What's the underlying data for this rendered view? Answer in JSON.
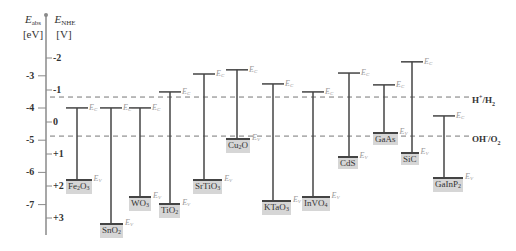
{
  "axes": {
    "left": {
      "symbol": "E",
      "subscript": "abs",
      "unit": "[eV]",
      "ticks": [
        -3,
        -4,
        -5,
        -6,
        -7
      ],
      "tick_labels": [
        "-3",
        "-4",
        "-5",
        "-6",
        "-7"
      ]
    },
    "right": {
      "symbol": "E",
      "subscript": "NHE",
      "unit": "[V]",
      "ticks": [
        -2,
        -1,
        0,
        1,
        2,
        3
      ],
      "tick_labels": [
        "-2",
        "-1",
        "0",
        "+1",
        "+2",
        "+3"
      ]
    }
  },
  "band_tags": {
    "cb": "E",
    "cb_sub": "C",
    "vb": "E",
    "vb_sub": "V"
  },
  "redox_levels": [
    {
      "name": "H+/H2",
      "label_main": "H",
      "label_sup": "+",
      "label_mid": "/H",
      "label_sub": "2",
      "potential_nhe": -0.78
    },
    {
      "name": "OH-/O2",
      "label_main": "OH",
      "label_sup": "-",
      "label_mid": "/O",
      "label_sub": "2",
      "potential_nhe": 0.44
    }
  ],
  "chart_data": {
    "type": "band-diagram",
    "title": "",
    "ylabel_left": "E_abs [eV]",
    "ylabel_right": "E_NHE [V]",
    "ylim_nhe": [
      -2.4,
      3.5
    ],
    "ylim_abs_ev": [
      -2.1,
      -7.9
    ],
    "redox": {
      "H+/H2_nhe": -0.78,
      "OH-/O2_nhe": 0.44
    },
    "materials": [
      {
        "name": "Fe2O3",
        "x": 77,
        "cb_nhe": -0.44,
        "vb_nhe": 1.81
      },
      {
        "name": "SnO2",
        "x": 111,
        "cb_nhe": -0.44,
        "vb_nhe": 3.19
      },
      {
        "name": "WO3",
        "x": 140,
        "cb_nhe": -0.44,
        "vb_nhe": 2.34
      },
      {
        "name": "TiO2",
        "x": 170,
        "cb_nhe": -0.94,
        "vb_nhe": 2.56
      },
      {
        "name": "SrTiO3",
        "x": 204,
        "cb_nhe": -1.5,
        "vb_nhe": 1.81
      },
      {
        "name": "Cu2O",
        "x": 237,
        "cb_nhe": -1.63,
        "vb_nhe": 0.53
      },
      {
        "name": "KTaO3",
        "x": 273,
        "cb_nhe": -1.19,
        "vb_nhe": 2.47
      },
      {
        "name": "InVO4",
        "x": 313,
        "cb_nhe": -0.94,
        "vb_nhe": 2.34
      },
      {
        "name": "CdS",
        "x": 349,
        "cb_nhe": -1.53,
        "vb_nhe": 1.09
      },
      {
        "name": "GaAs",
        "x": 384,
        "cb_nhe": -1.16,
        "vb_nhe": 0.34
      },
      {
        "name": "SiC",
        "x": 412,
        "cb_nhe": -1.88,
        "vb_nhe": 0.97
      },
      {
        "name": "GaInP2",
        "x": 444,
        "cb_nhe": -0.19,
        "vb_nhe": 1.75
      }
    ]
  },
  "materials_display": [
    {
      "base": "Fe",
      "s1": "2",
      "mid": "O",
      "s2": "3"
    },
    {
      "base": "SnO",
      "s1": "2",
      "mid": "",
      "s2": ""
    },
    {
      "base": "WO",
      "s1": "3",
      "mid": "",
      "s2": ""
    },
    {
      "base": "TiO",
      "s1": "2",
      "mid": "",
      "s2": ""
    },
    {
      "base": "SrTiO",
      "s1": "3",
      "mid": "",
      "s2": ""
    },
    {
      "base": "Cu",
      "s1": "2",
      "mid": "O",
      "s2": ""
    },
    {
      "base": "KTaO",
      "s1": "3",
      "mid": "",
      "s2": ""
    },
    {
      "base": "InVO",
      "s1": "4",
      "mid": "",
      "s2": ""
    },
    {
      "base": "CdS",
      "s1": "",
      "mid": "",
      "s2": ""
    },
    {
      "base": "GaAs",
      "s1": "",
      "mid": "",
      "s2": ""
    },
    {
      "base": "SiC",
      "s1": "",
      "mid": "",
      "s2": ""
    },
    {
      "base": "GaInP",
      "s1": "2",
      "mid": "",
      "s2": ""
    }
  ],
  "colors": {
    "axis": "#8a8a8a",
    "band": "#444444",
    "dash": "#777777",
    "tag": "#999999",
    "label_bg": "#d6d6d6"
  }
}
